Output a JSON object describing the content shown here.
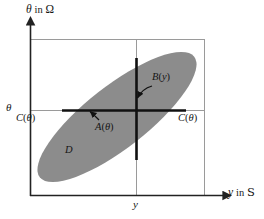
{
  "figure": {
    "title_none": "",
    "axes": {
      "y_axis_caption": {
        "symbol": "θ",
        "word": "in",
        "space": "Ω"
      },
      "x_axis_caption": {
        "symbol": "y",
        "word": "in",
        "space": "S"
      },
      "y_tick_label": "θ",
      "x_tick_label": "y"
    },
    "labels": {
      "c_theta_left": {
        "fn": "C",
        "open": "(",
        "arg": "θ",
        "close": ")"
      },
      "c_theta_right": {
        "fn": "C",
        "open": "(",
        "arg": "θ",
        "close": ")"
      },
      "a_theta": {
        "fn": "A",
        "open": "(",
        "arg": "θ",
        "close": ")"
      },
      "b_y": {
        "fn": "B",
        "open": "(",
        "arg": "y",
        "close": ")"
      },
      "region_d": "D"
    },
    "colors": {
      "region_fill": "#8c8c8c",
      "axis": "#222222",
      "gridline": "#9a9a9a",
      "bold_line": "#111111",
      "background": "#ffffff",
      "text": "#161616"
    },
    "geometry": {
      "theta_level_y": 110,
      "y_level_x": 136,
      "frame_left_x": 30,
      "frame_right_x": 204,
      "frame_top_y": 39,
      "frame_bottom_y": 196,
      "a_segment_x_range": [
        62,
        186
      ],
      "b_segment_y_range": [
        58,
        160
      ]
    }
  }
}
